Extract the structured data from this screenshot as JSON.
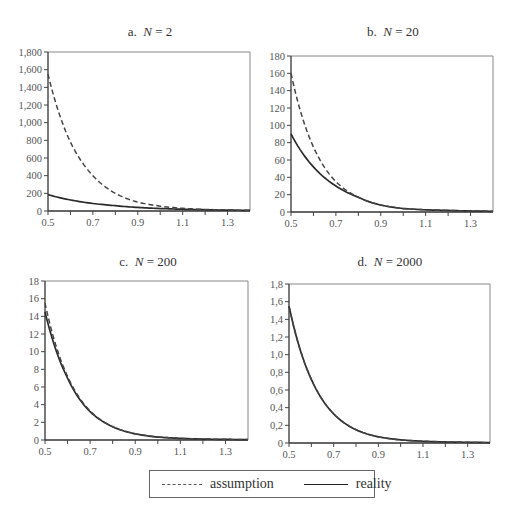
{
  "chart_data": [
    {
      "type": "line",
      "panel_id": "a",
      "title_prefix": "a.",
      "title_var": "N",
      "title_value": "= 2",
      "xlabel": "",
      "ylabel": "",
      "xlim": [
        0.5,
        1.4
      ],
      "ylim": [
        0,
        1800
      ],
      "x_ticks": [
        0.5,
        0.6,
        0.7,
        0.8,
        0.9,
        1.0,
        1.1,
        1.2,
        1.3
      ],
      "x_tick_labels": [
        "0.5",
        "",
        "0.7",
        "",
        "0.9",
        "",
        "1.1",
        "",
        "1.3"
      ],
      "y_ticks": [
        0,
        200,
        400,
        600,
        800,
        1000,
        1200,
        1400,
        1600,
        1800
      ],
      "y_tick_labels": [
        "0",
        "200",
        "400",
        "600",
        "800",
        "1,000",
        "1,200",
        "1,400",
        "1,600",
        "1,800"
      ],
      "x": [
        0.5,
        0.6,
        0.7,
        0.8,
        0.9,
        1.0,
        1.1,
        1.2,
        1.3,
        1.4
      ],
      "series": [
        {
          "name": "assumption",
          "style": "dashed",
          "values": [
            1550,
            780,
            400,
            200,
            100,
            55,
            30,
            18,
            12,
            8
          ]
        },
        {
          "name": "reality",
          "style": "solid",
          "values": [
            185,
            125,
            85,
            60,
            40,
            28,
            20,
            14,
            10,
            7
          ]
        }
      ]
    },
    {
      "type": "line",
      "panel_id": "b",
      "title_prefix": "b.",
      "title_var": "N",
      "title_value": "= 20",
      "xlabel": "",
      "ylabel": "",
      "xlim": [
        0.5,
        1.4
      ],
      "ylim": [
        0,
        180
      ],
      "x_ticks": [
        0.5,
        0.6,
        0.7,
        0.8,
        0.9,
        1.0,
        1.1,
        1.2,
        1.3
      ],
      "x_tick_labels": [
        "0.5",
        "",
        "0.7",
        "",
        "0.9",
        "",
        "1.1",
        "",
        "1.3"
      ],
      "y_ticks": [
        0,
        20,
        40,
        60,
        80,
        100,
        120,
        140,
        160,
        180
      ],
      "y_tick_labels": [
        "0",
        "20",
        "40",
        "60",
        "80",
        "100",
        "120",
        "140",
        "160",
        "180"
      ],
      "x": [
        0.5,
        0.6,
        0.7,
        0.8,
        0.9,
        1.0,
        1.1,
        1.2,
        1.3,
        1.4
      ],
      "series": [
        {
          "name": "assumption",
          "style": "dashed",
          "values": [
            160,
            75,
            35,
            17,
            8,
            4,
            2.5,
            1.8,
            1.2,
            0.8
          ]
        },
        {
          "name": "reality",
          "style": "solid",
          "values": [
            90,
            52,
            30,
            17,
            8,
            4,
            2.5,
            1.8,
            1.2,
            0.8
          ]
        }
      ]
    },
    {
      "type": "line",
      "panel_id": "c",
      "title_prefix": "c.",
      "title_var": "N",
      "title_value": "= 200",
      "xlabel": "",
      "ylabel": "",
      "xlim": [
        0.5,
        1.4
      ],
      "ylim": [
        0,
        18
      ],
      "x_ticks": [
        0.5,
        0.6,
        0.7,
        0.8,
        0.9,
        1.0,
        1.1,
        1.2,
        1.3
      ],
      "x_tick_labels": [
        "0.5",
        "",
        "0.7",
        "",
        "0.9",
        "",
        "1.1",
        "",
        "1.3"
      ],
      "y_ticks": [
        0,
        2,
        4,
        6,
        8,
        10,
        12,
        14,
        16,
        18
      ],
      "y_tick_labels": [
        "0",
        "2",
        "4",
        "6",
        "8",
        "10",
        "12",
        "14",
        "16",
        "18"
      ],
      "x": [
        0.5,
        0.6,
        0.7,
        0.8,
        0.9,
        1.0,
        1.1,
        1.2,
        1.3,
        1.4
      ],
      "series": [
        {
          "name": "assumption",
          "style": "dashed",
          "values": [
            15.5,
            7.2,
            3.3,
            1.5,
            0.7,
            0.35,
            0.2,
            0.12,
            0.08,
            0.05
          ]
        },
        {
          "name": "reality",
          "style": "solid",
          "values": [
            14.5,
            7.0,
            3.2,
            1.5,
            0.7,
            0.33,
            0.18,
            0.1,
            0.07,
            0.04
          ]
        }
      ]
    },
    {
      "type": "line",
      "panel_id": "d",
      "title_prefix": "d.",
      "title_var": "N",
      "title_value": "= 2000",
      "xlabel": "",
      "ylabel": "",
      "xlim": [
        0.5,
        1.4
      ],
      "ylim": [
        0,
        1.8
      ],
      "x_ticks": [
        0.5,
        0.6,
        0.7,
        0.8,
        0.9,
        1.0,
        1.1,
        1.2,
        1.3
      ],
      "x_tick_labels": [
        "0.5",
        "",
        "0.7",
        "",
        "0.9",
        "",
        "1.1",
        "",
        "1.3"
      ],
      "y_ticks": [
        0,
        0.2,
        0.4,
        0.6,
        0.8,
        1.0,
        1.2,
        1.4,
        1.6,
        1.8
      ],
      "y_tick_labels": [
        "0",
        "0,2",
        "0,4",
        "0,6",
        "0,8",
        "1,0",
        "1,2",
        "1,4",
        "1,6",
        "1,8"
      ],
      "x": [
        0.5,
        0.6,
        0.7,
        0.8,
        0.9,
        1.0,
        1.1,
        1.2,
        1.3,
        1.4
      ],
      "series": [
        {
          "name": "assumption",
          "style": "dashed",
          "values": [
            1.55,
            0.72,
            0.33,
            0.15,
            0.07,
            0.035,
            0.02,
            0.012,
            0.008,
            0.005
          ]
        },
        {
          "name": "reality",
          "style": "solid",
          "values": [
            1.55,
            0.72,
            0.33,
            0.15,
            0.07,
            0.035,
            0.02,
            0.012,
            0.008,
            0.005
          ]
        }
      ]
    }
  ],
  "legend": {
    "placement": "bottom-center",
    "items": [
      {
        "label": "assumption",
        "style": "dashed"
      },
      {
        "label": "reality",
        "style": "solid"
      }
    ]
  }
}
